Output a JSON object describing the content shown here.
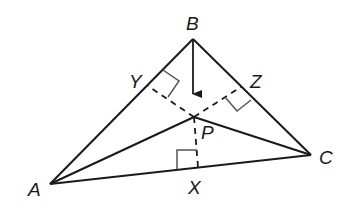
{
  "diagram": {
    "title": "",
    "points": {
      "A": {
        "label": "A",
        "x": 50,
        "y": 184
      },
      "B": {
        "label": "B",
        "x": 193,
        "y": 39
      },
      "C": {
        "label": "C",
        "x": 311,
        "y": 155
      },
      "P": {
        "label": "P",
        "x": 194,
        "y": 117
      },
      "X": {
        "label": "X",
        "x": 198,
        "y": 167
      },
      "Y": {
        "label": "Y",
        "x": 148,
        "y": 86
      },
      "Z": {
        "label": "Z",
        "x": 241,
        "y": 87
      }
    },
    "solid_segments": [
      "AB",
      "BC",
      "CA",
      "AP",
      "PC"
    ],
    "dashed_segments": [
      "PY",
      "PZ",
      "PX"
    ],
    "right_angle_marks": [
      "Y",
      "Z",
      "X"
    ],
    "arrow": {
      "from": "B",
      "direction": "down",
      "label": ""
    },
    "colors": {
      "stroke": "#1a1a1a",
      "mark": "#555555",
      "background": "#ffffff"
    }
  }
}
